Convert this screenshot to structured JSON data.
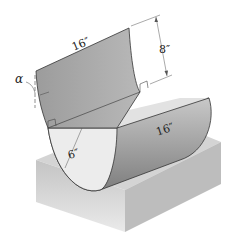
{
  "diagram": {
    "labels": {
      "plate_length": "16″",
      "plate_height": "8″",
      "trough_length": "16″",
      "radius": "6″",
      "angle": "α"
    },
    "colors": {
      "plate": "#a9a9a9",
      "trough_outer": "#9a9a9a",
      "trough_inner": "#d6d6d6",
      "end_face": "#ececec",
      "base_top": "#d2d2d2",
      "base_side": "#b8b8b8",
      "outline": "#333333"
    }
  }
}
